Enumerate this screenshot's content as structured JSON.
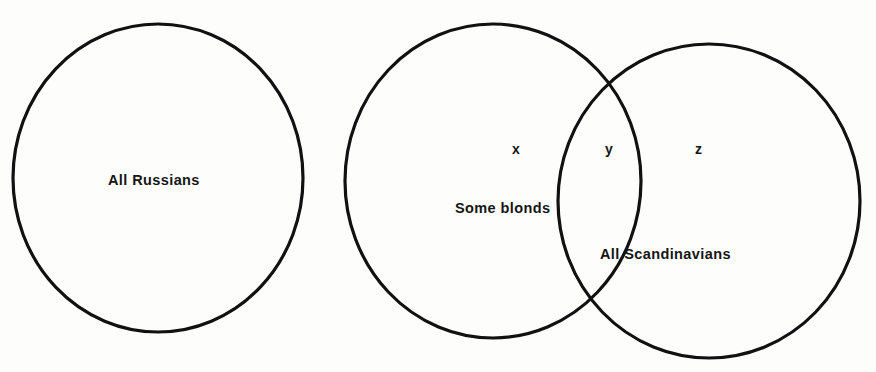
{
  "figure": {
    "type": "venn-diagram",
    "background_color": "#fdfdfb",
    "stroke_color": "#111111"
  },
  "sets": [
    {
      "id": "all-russians",
      "label": "All  Russians",
      "cx": 158,
      "cy": 178,
      "rx": 145,
      "ry": 154
    },
    {
      "id": "some-blonds",
      "label": "Some blonds",
      "cx": 493,
      "cy": 181,
      "rx": 148,
      "ry": 157
    },
    {
      "id": "all-scandinavians",
      "label": "All  Scandinavians",
      "cx": 709,
      "cy": 201,
      "rx": 151,
      "ry": 157
    }
  ],
  "regions": [
    {
      "id": "x",
      "label": "x",
      "meaning": "blonds only"
    },
    {
      "id": "y",
      "label": "y",
      "meaning": "blonds and Scandinavians"
    },
    {
      "id": "z",
      "label": "z",
      "meaning": "Scandinavians only"
    }
  ]
}
